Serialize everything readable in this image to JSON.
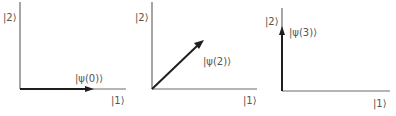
{
  "diagram": {
    "type": "state-vector-rotation",
    "panels": [
      {
        "id": "panel-0",
        "y_axis_label": "|2⟩",
        "x_axis_label": "|1⟩",
        "vector_label": "|ψ(0)⟩",
        "vector_direction": "along |1⟩"
      },
      {
        "id": "panel-2",
        "y_axis_label": "|2⟩",
        "x_axis_label": "|1⟩",
        "vector_label": "|ψ(2)⟩",
        "vector_direction": "45° between |1⟩ and |2⟩"
      },
      {
        "id": "panel-3",
        "y_axis_label": "|2⟩",
        "x_axis_label": "|1⟩",
        "vector_label": "|ψ(3)⟩",
        "vector_direction": "along |2⟩"
      }
    ],
    "colors": {
      "axis": "#6a6a6a",
      "vector": "#1e1e1e",
      "label": "#555555"
    }
  }
}
